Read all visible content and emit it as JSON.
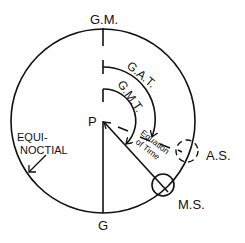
{
  "diagram": {
    "labels": {
      "gm": "G.M.",
      "g": "G",
      "p": "P",
      "gat": "G.A.T.",
      "gmt": "G.M.T.",
      "equation_line1": "Equation",
      "equation_line2": "of Time",
      "as": "A.S.",
      "ms": "M.S.",
      "equinoctial_line1": "EQUI-",
      "equinoctial_line2": "NOCTIAL"
    },
    "colors": {
      "stroke": "#111111",
      "background": "#ffffff"
    }
  }
}
